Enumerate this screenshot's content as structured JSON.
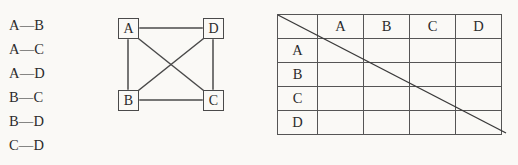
{
  "page": {
    "background_color": "#faf9f6",
    "ink_color": "#2b2b2b",
    "line_color": "#4a4a4a",
    "top_cut_text": "· · · · · · · · · · · · · · · · · · · · · · · · · · ·"
  },
  "edge_list": {
    "separator": "—",
    "items": [
      {
        "from": "A",
        "to": "B",
        "label": "A—B"
      },
      {
        "from": "A",
        "to": "C",
        "label": "A—C"
      },
      {
        "from": "A",
        "to": "D",
        "label": "A—D"
      },
      {
        "from": "B",
        "to": "C",
        "label": "B—C"
      },
      {
        "from": "B",
        "to": "D",
        "label": "B—D"
      },
      {
        "from": "C",
        "to": "D",
        "label": "C—D"
      }
    ]
  },
  "graph": {
    "nodes": [
      {
        "id": "A",
        "label": "A",
        "position": "top-left"
      },
      {
        "id": "D",
        "label": "D",
        "position": "top-right"
      },
      {
        "id": "B",
        "label": "B",
        "position": "bottom-left"
      },
      {
        "id": "C",
        "label": "C",
        "position": "bottom-right"
      }
    ],
    "edges": [
      {
        "from": "A",
        "to": "D",
        "kind": "top-horizontal"
      },
      {
        "from": "A",
        "to": "B",
        "kind": "left-vertical"
      },
      {
        "from": "D",
        "to": "C",
        "kind": "right-vertical"
      },
      {
        "from": "B",
        "to": "C",
        "kind": "bottom-horizontal"
      },
      {
        "from": "A",
        "to": "C",
        "kind": "diagonal"
      },
      {
        "from": "B",
        "to": "D",
        "kind": "diagonal"
      }
    ]
  },
  "matrix": {
    "corner_label": "",
    "column_headers": [
      "A",
      "B",
      "C",
      "D"
    ],
    "row_headers": [
      "A",
      "B",
      "C",
      "D"
    ],
    "cells": [
      [
        "",
        "",
        "",
        ""
      ],
      [
        "",
        "",
        "",
        ""
      ],
      [
        "",
        "",
        "",
        ""
      ],
      [
        "",
        "",
        "",
        ""
      ]
    ],
    "has_diagonal_line": true
  }
}
